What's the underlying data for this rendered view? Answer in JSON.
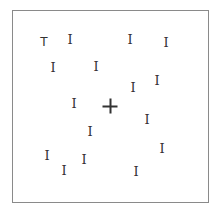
{
  "stimulus": {
    "type": "visual-search-display",
    "frame_color": "#8a8a8a",
    "glyph_color": "#333333",
    "fixation": {
      "x": 110,
      "y": 106,
      "symbol": "+"
    },
    "items": [
      {
        "char": "T",
        "role": "target",
        "x": 44,
        "y": 42
      },
      {
        "char": "I",
        "role": "distractor",
        "x": 70,
        "y": 39
      },
      {
        "char": "I",
        "role": "distractor",
        "x": 130,
        "y": 39
      },
      {
        "char": "I",
        "role": "distractor",
        "x": 166,
        "y": 42
      },
      {
        "char": "I",
        "role": "distractor",
        "x": 53,
        "y": 67
      },
      {
        "char": "I",
        "role": "distractor",
        "x": 96,
        "y": 66
      },
      {
        "char": "I",
        "role": "distractor",
        "x": 157,
        "y": 80
      },
      {
        "char": "I",
        "role": "distractor",
        "x": 133,
        "y": 87
      },
      {
        "char": "I",
        "role": "distractor",
        "x": 74,
        "y": 103
      },
      {
        "char": "I",
        "role": "distractor",
        "x": 147,
        "y": 119
      },
      {
        "char": "I",
        "role": "distractor",
        "x": 90,
        "y": 131
      },
      {
        "char": "I",
        "role": "distractor",
        "x": 162,
        "y": 148
      },
      {
        "char": "I",
        "role": "distractor",
        "x": 47,
        "y": 155
      },
      {
        "char": "I",
        "role": "distractor",
        "x": 84,
        "y": 159
      },
      {
        "char": "I",
        "role": "distractor",
        "x": 64,
        "y": 170
      },
      {
        "char": "I",
        "role": "distractor",
        "x": 136,
        "y": 171
      }
    ]
  }
}
